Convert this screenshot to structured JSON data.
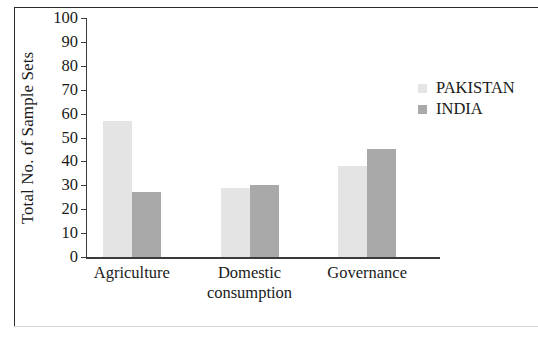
{
  "chart_data": {
    "type": "bar",
    "title": "",
    "xlabel": "",
    "ylabel": "Total No. of Sample Sets",
    "categories": [
      "Agriculture",
      "Domestic consumption",
      "Governance"
    ],
    "category_lines": [
      [
        "Agriculture"
      ],
      [
        "Domestic",
        "consumption"
      ],
      [
        "Governance"
      ]
    ],
    "series": [
      {
        "name": "PAKISTAN",
        "color": "#e4e4e4",
        "values": [
          57,
          29,
          38
        ]
      },
      {
        "name": "INDIA",
        "color": "#a9a9a9",
        "values": [
          27,
          30,
          45
        ]
      }
    ],
    "ylim": [
      0,
      100
    ],
    "ytick_values": [
      100,
      90,
      80,
      70,
      60,
      50,
      40,
      30,
      20,
      10,
      0
    ],
    "ytick_labels": [
      "100",
      "90",
      "80",
      "70",
      "60",
      "50",
      "40",
      "30",
      "20",
      "10",
      "0"
    ],
    "grid": false,
    "legend_position": "right"
  },
  "legend": {
    "entries": [
      {
        "label": "PAKISTAN",
        "color": "#e4e4e4"
      },
      {
        "label": "INDIA",
        "color": "#a9a9a9"
      }
    ]
  }
}
